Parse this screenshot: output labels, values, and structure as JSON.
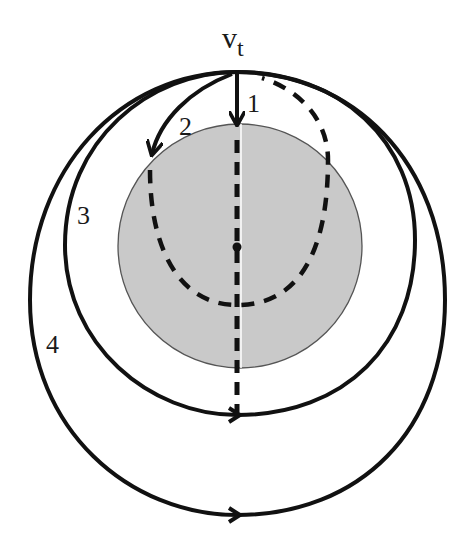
{
  "diagram": {
    "type": "orbital-trajectories",
    "velocity_label": "v",
    "velocity_subscript": "t",
    "trajectory_labels": [
      "1",
      "2",
      "3",
      "4"
    ],
    "colors": {
      "planet_fill": "#c9c9c9",
      "planet_stroke": "#555555",
      "line": "#111111",
      "center_line": "#ffffff",
      "background": "#ffffff"
    }
  }
}
